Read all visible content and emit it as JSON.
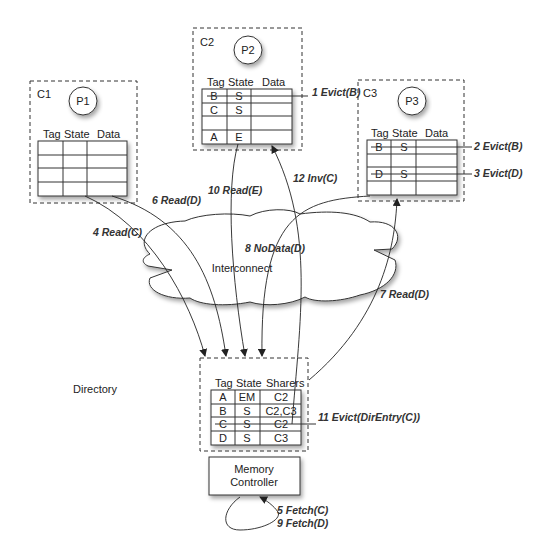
{
  "caches": [
    {
      "id": "C1",
      "processor": "P1",
      "headers": [
        "Tag",
        "State",
        "Data"
      ],
      "rows": [
        [
          "",
          "",
          ""
        ],
        [
          "",
          "",
          ""
        ],
        [
          "",
          "",
          ""
        ],
        [
          "",
          "",
          ""
        ]
      ]
    },
    {
      "id": "C2",
      "processor": "P2",
      "headers": [
        "Tag",
        "State",
        "Data"
      ],
      "rows": [
        [
          "B",
          "S",
          ""
        ],
        [
          "C",
          "S",
          ""
        ],
        [
          "",
          "",
          ""
        ],
        [
          "A",
          "E",
          ""
        ]
      ],
      "struck_rows": [
        0
      ]
    },
    {
      "id": "C3",
      "processor": "P3",
      "headers": [
        "Tag",
        "State",
        "Data"
      ],
      "rows": [
        [
          "B",
          "S",
          ""
        ],
        [
          "",
          "",
          ""
        ],
        [
          "D",
          "S",
          ""
        ],
        [
          "",
          "",
          ""
        ]
      ],
      "struck_rows": [
        0,
        2
      ]
    }
  ],
  "interconnect": {
    "label": "Interconnect"
  },
  "directory": {
    "label": "Directory",
    "headers": [
      "Tag",
      "State",
      "Sharers"
    ],
    "rows": [
      [
        "A",
        "EM",
        "C2"
      ],
      [
        "B",
        "S",
        "C2,C3"
      ],
      [
        "C",
        "S",
        "C2"
      ],
      [
        "D",
        "S",
        "C3"
      ]
    ],
    "struck_rows": [
      2
    ]
  },
  "memory_controller": {
    "line1": "Memory",
    "line2": "Controller"
  },
  "messages": {
    "m1": "1 Evict(B)",
    "m2": "2 Evict(B)",
    "m3": "3 Evict(D)",
    "m4": "4 Read(C)",
    "m5": "5 Fetch(C)",
    "m6": "6 Read(D)",
    "m7": "7 Read(D)",
    "m8": "8 NoData(D)",
    "m9": "9 Fetch(D)",
    "m10": "10 Read(E)",
    "m11": "11 Evict(DirEntry(C))",
    "m12": "12 Inv(C)"
  }
}
